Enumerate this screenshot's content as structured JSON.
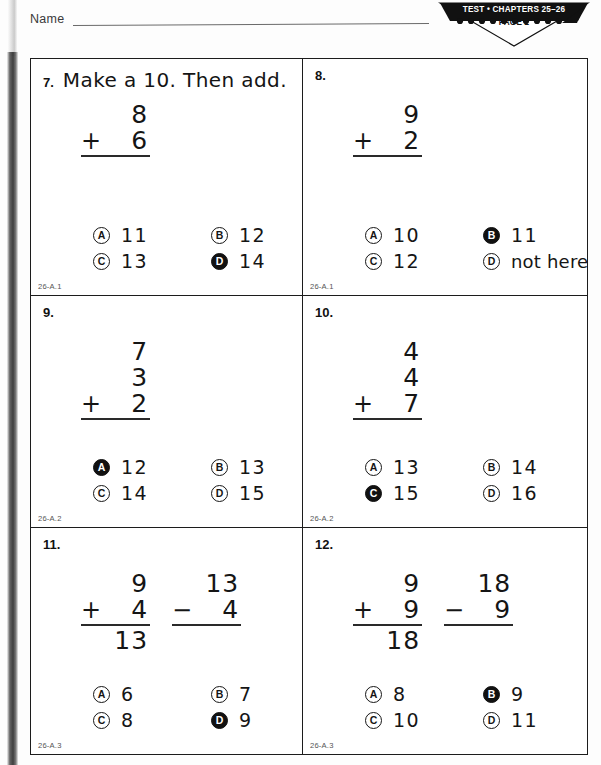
{
  "header": {
    "name_label": "Name",
    "banner_line1": "TEST • CHAPTERS 25–26",
    "banner_line2": "PAGE 2"
  },
  "questions": [
    {
      "number": "7.",
      "prompt": "Make a 10. Then add.",
      "problems": [
        {
          "operator": "",
          "top": "8",
          "bottom": "6",
          "op": "+",
          "sum": ""
        }
      ],
      "choices": [
        {
          "letter": "A",
          "text": "11",
          "filled": false
        },
        {
          "letter": "B",
          "text": "12",
          "filled": false
        },
        {
          "letter": "C",
          "text": "13",
          "filled": false
        },
        {
          "letter": "D",
          "text": "14",
          "filled": true
        }
      ],
      "objective": "26-A.1"
    },
    {
      "number": "8.",
      "prompt": "",
      "problems": [
        {
          "operator": "",
          "top": "9",
          "bottom": "2",
          "op": "+",
          "sum": ""
        }
      ],
      "choices": [
        {
          "letter": "A",
          "text": "10",
          "filled": false
        },
        {
          "letter": "B",
          "text": "11",
          "filled": true
        },
        {
          "letter": "C",
          "text": "12",
          "filled": false
        },
        {
          "letter": "D",
          "text": "not here",
          "filled": false
        }
      ],
      "objective": "26-A.1"
    },
    {
      "number": "9.",
      "prompt": "",
      "problems": [
        {
          "operator": "",
          "top": "7",
          "middle": "3",
          "bottom": "2",
          "op": "+",
          "sum": ""
        }
      ],
      "choices": [
        {
          "letter": "A",
          "text": "12",
          "filled": true
        },
        {
          "letter": "B",
          "text": "13",
          "filled": false
        },
        {
          "letter": "C",
          "text": "14",
          "filled": false
        },
        {
          "letter": "D",
          "text": "15",
          "filled": false
        }
      ],
      "objective": "26-A.2"
    },
    {
      "number": "10.",
      "prompt": "",
      "problems": [
        {
          "operator": "",
          "top": "4",
          "middle": "4",
          "bottom": "7",
          "op": "+",
          "sum": ""
        }
      ],
      "choices": [
        {
          "letter": "A",
          "text": "13",
          "filled": false
        },
        {
          "letter": "B",
          "text": "14",
          "filled": false
        },
        {
          "letter": "C",
          "text": "15",
          "filled": true
        },
        {
          "letter": "D",
          "text": "16",
          "filled": false
        }
      ],
      "objective": "26-A.2"
    },
    {
      "number": "11.",
      "prompt": "",
      "problems": [
        {
          "operator": "",
          "top": "9",
          "bottom": "4",
          "op": "+",
          "sum": "13"
        },
        {
          "operator": "",
          "top": "13",
          "bottom": "4",
          "op": "−",
          "sum": ""
        }
      ],
      "choices": [
        {
          "letter": "A",
          "text": "6",
          "filled": false
        },
        {
          "letter": "B",
          "text": "7",
          "filled": false
        },
        {
          "letter": "C",
          "text": "8",
          "filled": false
        },
        {
          "letter": "D",
          "text": "9",
          "filled": true
        }
      ],
      "objective": "26-A.3"
    },
    {
      "number": "12.",
      "prompt": "",
      "problems": [
        {
          "operator": "",
          "top": "9",
          "bottom": "9",
          "op": "+",
          "sum": "18"
        },
        {
          "operator": "",
          "top": "18",
          "bottom": "9",
          "op": "−",
          "sum": ""
        }
      ],
      "choices": [
        {
          "letter": "A",
          "text": "8",
          "filled": false
        },
        {
          "letter": "B",
          "text": "9",
          "filled": true
        },
        {
          "letter": "C",
          "text": "10",
          "filled": false
        },
        {
          "letter": "D",
          "text": "11",
          "filled": false
        }
      ],
      "objective": "26-A.3"
    }
  ]
}
